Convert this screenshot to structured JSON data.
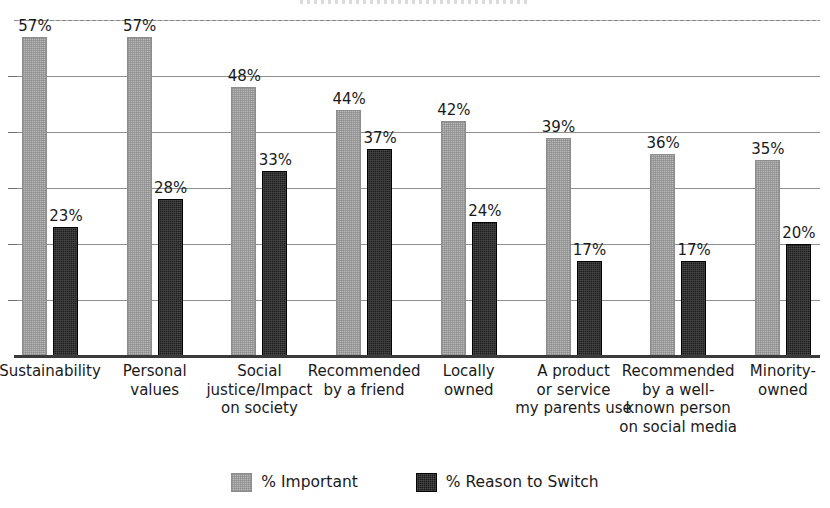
{
  "chart_data": {
    "type": "bar",
    "title": "",
    "xlabel": "",
    "ylabel": "",
    "ylim": [
      0,
      60
    ],
    "grid": true,
    "gridlines": [
      0,
      10,
      20,
      30,
      40,
      50,
      60
    ],
    "y_tick_labels_shown": false,
    "legend_position": "bottom-center",
    "categories": [
      "Sustainability",
      "Personal values",
      "Social justice/Impact on society",
      "Recommended by a friend",
      "Locally owned",
      "A product or service my parents use",
      "Recommended by a well-known person on social media",
      "Minority-owned"
    ],
    "category_label_lines": [
      [
        "Sustainability"
      ],
      [
        "Personal",
        "values"
      ],
      [
        "Social",
        "justice/Impact",
        "on society"
      ],
      [
        "Recommended",
        "by a friend"
      ],
      [
        "Locally",
        "owned"
      ],
      [
        "A product",
        "or service",
        "my parents use"
      ],
      [
        "Recommended",
        "by a well-",
        "known person",
        "on social media"
      ],
      [
        "Minority-",
        "owned"
      ]
    ],
    "series": [
      {
        "name": "% Important",
        "color": "#b9b9b9",
        "values": [
          57,
          57,
          48,
          44,
          42,
          39,
          36,
          35
        ],
        "labels": [
          "57%",
          "57%",
          "48%",
          "44%",
          "42%",
          "39%",
          "36%",
          "35%"
        ]
      },
      {
        "name": "% Reason to Switch",
        "color": "#1c1c1c",
        "values": [
          23,
          28,
          33,
          37,
          24,
          17,
          17,
          20
        ],
        "labels": [
          "23%",
          "28%",
          "33%",
          "37%",
          "24%",
          "17%",
          "17%",
          "20%"
        ]
      }
    ]
  },
  "legend": {
    "items": [
      {
        "label": "% Important",
        "swatch": "important"
      },
      {
        "label": "% Reason to Switch",
        "swatch": "switch"
      }
    ]
  }
}
